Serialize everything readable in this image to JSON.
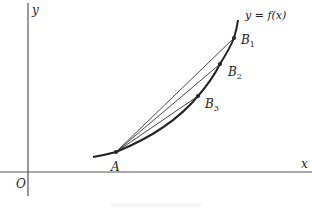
{
  "figure": {
    "axes": {
      "x_label": "x",
      "y_label": "y",
      "origin_label": "O"
    },
    "curve_label": "y = f(x)",
    "points": [
      {
        "id": "A",
        "label": "A",
        "sub": ""
      },
      {
        "id": "B1",
        "label": "B",
        "sub": "1"
      },
      {
        "id": "B2",
        "label": "B",
        "sub": "2"
      },
      {
        "id": "B3",
        "label": "B",
        "sub": "3"
      }
    ],
    "colors": {
      "ink": "#222222",
      "background": "#ffffff"
    }
  }
}
